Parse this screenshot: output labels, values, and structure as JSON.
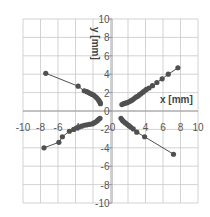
{
  "chart_data": {
    "type": "scatter",
    "title": "",
    "xlabel": "x [mm]",
    "ylabel": "y [mm]",
    "xlim": [
      -10,
      10
    ],
    "ylim": [
      -10,
      10
    ],
    "grid": true,
    "legend": null,
    "x_ticks": [
      -10,
      -8,
      -6,
      -4,
      -2,
      0,
      2,
      4,
      6,
      8,
      10
    ],
    "y_ticks": [
      -10,
      -8,
      -6,
      -4,
      -2,
      0,
      2,
      4,
      6,
      8,
      10
    ],
    "x_tick_labels": [
      "-10",
      "-8",
      "-6",
      "-4",
      "",
      "0",
      "",
      "4",
      "6",
      "8",
      "10"
    ],
    "y_tick_labels": [
      "-10",
      "-8",
      "-6",
      "-4",
      "-2",
      "0",
      "2",
      "4",
      "6",
      "8",
      "10"
    ],
    "series": [
      {
        "name": "upper-left",
        "marker_color": "#505050",
        "line_color": "#505050",
        "points": [
          [
            -7.4,
            4.1
          ],
          [
            -3.7,
            2.7
          ],
          [
            -3.0,
            2.2
          ],
          [
            -2.7,
            2.1
          ],
          [
            -2.5,
            2.0
          ],
          [
            -2.3,
            1.9
          ],
          [
            -2.1,
            1.8
          ],
          [
            -1.9,
            1.7
          ],
          [
            -1.7,
            1.55
          ],
          [
            -1.55,
            1.4
          ],
          [
            -1.4,
            1.25
          ],
          [
            -1.3,
            1.1
          ],
          [
            -1.2,
            0.95
          ],
          [
            -1.15,
            0.8
          ]
        ]
      },
      {
        "name": "upper-right",
        "marker_color": "#505050",
        "line_color": "#505050",
        "points": [
          [
            1.3,
            0.7
          ],
          [
            1.5,
            0.8
          ],
          [
            1.7,
            0.85
          ],
          [
            1.9,
            0.9
          ],
          [
            2.1,
            1.0
          ],
          [
            2.3,
            1.1
          ],
          [
            2.5,
            1.2
          ],
          [
            2.7,
            1.35
          ],
          [
            2.9,
            1.5
          ],
          [
            3.1,
            1.6
          ],
          [
            3.3,
            1.75
          ],
          [
            3.5,
            1.9
          ],
          [
            3.7,
            2.05
          ],
          [
            3.9,
            2.2
          ],
          [
            4.1,
            2.35
          ],
          [
            4.4,
            2.5
          ],
          [
            4.8,
            2.75
          ],
          [
            5.3,
            3.1
          ],
          [
            5.9,
            3.5
          ],
          [
            6.6,
            4.0
          ],
          [
            7.7,
            4.7
          ]
        ]
      },
      {
        "name": "lower-left",
        "marker_color": "#505050",
        "line_color": "#505050",
        "points": [
          [
            -7.6,
            -4.0
          ],
          [
            -5.9,
            -3.4
          ],
          [
            -5.5,
            -2.8
          ],
          [
            -4.7,
            -2.2
          ],
          [
            -4.2,
            -2.0
          ],
          [
            -3.9,
            -1.85
          ],
          [
            -3.6,
            -1.75
          ],
          [
            -3.3,
            -1.65
          ],
          [
            -3.0,
            -1.55
          ],
          [
            -2.7,
            -1.5
          ],
          [
            -2.4,
            -1.45
          ],
          [
            -2.1,
            -1.4
          ],
          [
            -1.9,
            -1.3
          ],
          [
            -1.7,
            -1.2
          ],
          [
            -1.5,
            -1.05
          ],
          [
            -1.35,
            -0.9
          ],
          [
            -1.2,
            -0.8
          ]
        ]
      },
      {
        "name": "lower-right",
        "marker_color": "#505050",
        "line_color": "#505050",
        "points": [
          [
            1.2,
            -0.8
          ],
          [
            1.35,
            -1.0
          ],
          [
            1.5,
            -1.15
          ],
          [
            1.7,
            -1.3
          ],
          [
            1.9,
            -1.45
          ],
          [
            2.1,
            -1.6
          ],
          [
            2.3,
            -1.75
          ],
          [
            2.6,
            -1.95
          ],
          [
            3.0,
            -2.3
          ],
          [
            3.9,
            -2.8
          ],
          [
            7.2,
            -4.7
          ]
        ]
      }
    ]
  }
}
